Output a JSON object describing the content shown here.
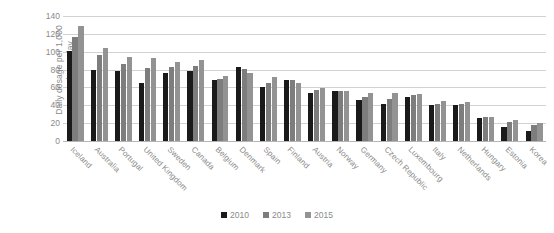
{
  "chart_data": {
    "type": "bar",
    "title": "",
    "subtitle": "",
    "xlabel": "",
    "ylabel": "Daily dosage per 1,000 people per day",
    "ylabel_line1": "Daily dosage per 1,000",
    "ylabel_line2": "people per day",
    "ylim": [
      0,
      140
    ],
    "ytick_step": 20,
    "yticks": [
      0,
      20,
      40,
      60,
      80,
      100,
      120,
      140
    ],
    "grid": true,
    "legend_position": "bottom",
    "categories": [
      "Iceland",
      "Australia",
      "Portugal",
      "United Kingdom",
      "Sweden",
      "Canada",
      "Belgium",
      "Denmark",
      "Spain",
      "Finland",
      "Austria",
      "Norway",
      "Germany",
      "Czech Republic",
      "Luxembourg",
      "Italy",
      "Netherlands",
      "Hungary",
      "Estonia",
      "Korea"
    ],
    "series": [
      {
        "name": "2010",
        "color": "#1a1a1a",
        "values": [
          101,
          80,
          78,
          65,
          76,
          78,
          68,
          83,
          61,
          68,
          54,
          56,
          46,
          41,
          49,
          40,
          40,
          26,
          16,
          11
        ]
      },
      {
        "name": "2013",
        "color": "#7d7d7d",
        "values": [
          117,
          96,
          86,
          82,
          83,
          84,
          70,
          81,
          65,
          68,
          57,
          56,
          49,
          47,
          52,
          42,
          42,
          27,
          21,
          18
        ]
      },
      {
        "name": "2015",
        "color": "#939393",
        "values": [
          129,
          104,
          94,
          93,
          89,
          91,
          73,
          76,
          72,
          65,
          59,
          56,
          54,
          54,
          53,
          45,
          44,
          27,
          23,
          20
        ]
      }
    ]
  },
  "legend": {
    "items": [
      {
        "label": "2010",
        "color": "#1a1a1a"
      },
      {
        "label": "2013",
        "color": "#7d7d7d"
      },
      {
        "label": "2015",
        "color": "#939393"
      }
    ]
  },
  "colors": {
    "grid": "#d2d2d2",
    "axis": "#b5b5b5",
    "text": "#8a8a8a",
    "background": "#ffffff"
  }
}
